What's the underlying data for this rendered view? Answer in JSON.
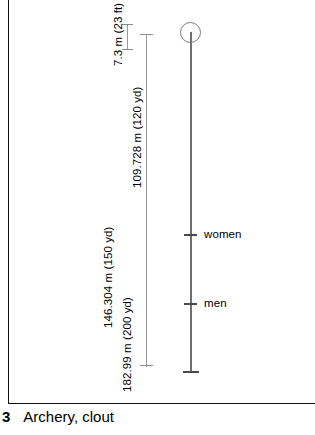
{
  "diagram": {
    "title": "Archery, clout",
    "caption_number": "3",
    "caption_text": "Archery, clout",
    "target": {
      "icon": "clout-target-circle",
      "label": ""
    },
    "dimensions": [
      {
        "id": "height-7-3",
        "text": "7.3 m (23 ft)",
        "metric_value": 7.3,
        "metric_unit": "m",
        "imperial_value": 23,
        "imperial_unit": "ft"
      },
      {
        "id": "distance-109",
        "text": "109.728 m (120 yd)",
        "metric_value": 109.728,
        "metric_unit": "m",
        "imperial_value": 120,
        "imperial_unit": "yd"
      },
      {
        "id": "distance-146",
        "text": "146.304 m (150 yd)",
        "metric_value": 146.304,
        "metric_unit": "m",
        "imperial_value": 150,
        "imperial_unit": "yd"
      },
      {
        "id": "distance-182",
        "text": "182.99 m (200 yd)",
        "metric_value": 182.99,
        "metric_unit": "m",
        "imperial_value": 200,
        "imperial_unit": "yd"
      }
    ],
    "shooting_marks": [
      {
        "id": "women",
        "label": "women"
      },
      {
        "id": "men",
        "label": "men"
      }
    ],
    "colors": {
      "frame": "#111111",
      "range_line": "#6e6e6e",
      "dimension_line": "#9a9a9a",
      "tick": "#4a4a4a",
      "text": "#000000",
      "background": "#ffffff"
    }
  }
}
